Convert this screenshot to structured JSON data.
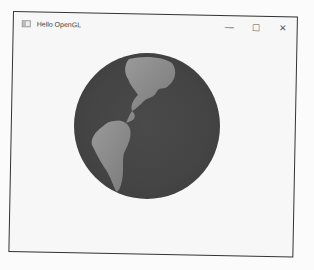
{
  "window": {
    "title": "Hello OpenGL",
    "icons": {
      "app": "app-window-icon",
      "minimize": "minimize-icon",
      "maximize": "maximize-icon",
      "close": "close-icon"
    },
    "controls": {
      "minimize": "—",
      "maximize": "☐",
      "close": "✕"
    }
  },
  "content": {
    "render": "globe",
    "visible_regions": [
      "North America",
      "Central America",
      "South America"
    ],
    "colors": {
      "ocean": "#444444",
      "land": "#8a8a8a",
      "background": "#f7f7f7"
    }
  }
}
